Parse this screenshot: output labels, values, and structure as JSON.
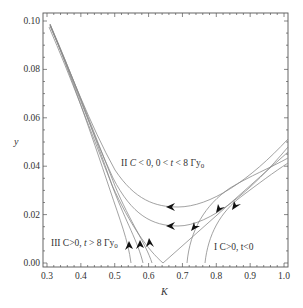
{
  "chart_data": {
    "type": "line",
    "title": "",
    "xlabel": "K",
    "ylabel": "y",
    "xlim": [
      0.3,
      1.0
    ],
    "ylim": [
      0.0,
      0.1
    ],
    "grid": false,
    "legend": null,
    "x_ticks": [
      "0.3",
      "0.4",
      "0.5",
      "0.6",
      "0.7",
      "0.8",
      "0.9",
      "1.0"
    ],
    "y_ticks": [
      "0.00",
      "0.02",
      "0.04",
      "0.06",
      "0.08",
      "0.10"
    ],
    "annotations": [
      {
        "id": "region-II",
        "text_main": "II C < 0,  0 < t < 8 Γy",
        "subscript": "0",
        "x": 0.52,
        "y": 0.046
      },
      {
        "id": "region-III",
        "text_main": "III C>0, t > 8 Γy",
        "subscript": "0",
        "x": 0.31,
        "y": 0.011
      },
      {
        "id": "region-I",
        "text_main": "I C>0, t<0",
        "x": 0.77,
        "y": 0.008
      }
    ],
    "series": [
      {
        "name": "region-II-upper",
        "points": [
          [
            0.31,
            0.097
          ],
          [
            0.4,
            0.067
          ],
          [
            0.5,
            0.037
          ],
          [
            0.58,
            0.024
          ],
          [
            0.64,
            0.019
          ],
          [
            0.7,
            0.019
          ],
          [
            0.8,
            0.024
          ],
          [
            0.9,
            0.033
          ],
          [
            1.0,
            0.052
          ]
        ],
        "arrows": [
          [
            0.66,
            0.019
          ]
        ]
      },
      {
        "name": "region-II-lower",
        "points": [
          [
            0.31,
            0.098
          ],
          [
            0.4,
            0.066
          ],
          [
            0.5,
            0.035
          ],
          [
            0.58,
            0.02
          ],
          [
            0.64,
            0.015
          ],
          [
            0.7,
            0.015
          ],
          [
            0.8,
            0.02
          ],
          [
            0.9,
            0.029
          ],
          [
            1.0,
            0.048
          ]
        ],
        "arrows": [
          [
            0.66,
            0.015
          ]
        ]
      },
      {
        "name": "separatrix",
        "points": [
          [
            0.31,
            0.096
          ],
          [
            0.4,
            0.065
          ],
          [
            0.5,
            0.034
          ],
          [
            0.6,
            0.012
          ],
          [
            0.645,
            0.0
          ],
          [
            0.7,
            0.007
          ],
          [
            0.8,
            0.022
          ],
          [
            0.9,
            0.034
          ],
          [
            1.0,
            0.046
          ]
        ],
        "arrows": [
          [
            0.73,
            0.01
          ],
          [
            0.55,
            0.009
          ]
        ]
      },
      {
        "name": "region-III-a",
        "points": [
          [
            0.31,
            0.099
          ],
          [
            0.4,
            0.068
          ],
          [
            0.5,
            0.032
          ],
          [
            0.55,
            0.012
          ],
          [
            0.555,
            0.0
          ]
        ],
        "arrows": [
          [
            0.535,
            0.006
          ]
        ]
      },
      {
        "name": "region-III-b",
        "points": [
          [
            0.31,
            0.099
          ],
          [
            0.4,
            0.068
          ],
          [
            0.5,
            0.034
          ],
          [
            0.57,
            0.012
          ],
          [
            0.59,
            0.0
          ]
        ],
        "arrows": [
          [
            0.565,
            0.007
          ]
        ]
      },
      {
        "name": "region-III-c",
        "points": [
          [
            0.31,
            0.098
          ],
          [
            0.4,
            0.067
          ],
          [
            0.5,
            0.034
          ],
          [
            0.58,
            0.013
          ],
          [
            0.6,
            0.0
          ]
        ],
        "arrows": [
          [
            0.58,
            0.007
          ]
        ]
      },
      {
        "name": "region-I-a",
        "points": [
          [
            0.715,
            0.0
          ],
          [
            0.74,
            0.01
          ],
          [
            0.8,
            0.023
          ],
          [
            0.9,
            0.035
          ],
          [
            1.0,
            0.044
          ]
        ],
        "arrows": [
          [
            0.8,
            0.022
          ]
        ]
      },
      {
        "name": "region-I-b",
        "points": [
          [
            0.77,
            0.0
          ],
          [
            0.79,
            0.01
          ],
          [
            0.85,
            0.022
          ],
          [
            0.92,
            0.033
          ],
          [
            1.0,
            0.042
          ]
        ],
        "arrows": [
          [
            0.84,
            0.022
          ]
        ]
      }
    ]
  },
  "axes": {
    "x_label": "K",
    "y_label": "y",
    "x_ticks": [
      "0.3",
      "0.4",
      "0.5",
      "0.6",
      "0.7",
      "0.8",
      "0.9",
      "1.0"
    ],
    "y_ticks": [
      "0.00",
      "0.02",
      "0.04",
      "0.06",
      "0.08",
      "0.10"
    ]
  },
  "regions": {
    "II": {
      "label": "II ",
      "cond": "C < 0,  0 < t < 8 Γy",
      "sub": "0"
    },
    "III": {
      "label": "III C>0, t > 8 Γy",
      "sub": "0"
    },
    "I": {
      "label": "I C>0, t<0"
    }
  }
}
